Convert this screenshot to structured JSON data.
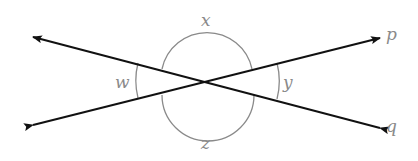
{
  "diagram": {
    "type": "intersecting-lines-angles",
    "lines": [
      {
        "name": "p",
        "label": "p"
      },
      {
        "name": "q",
        "label": "q"
      }
    ],
    "angles": [
      {
        "name": "x",
        "label": "x",
        "position": "top"
      },
      {
        "name": "y",
        "label": "y",
        "position": "right"
      },
      {
        "name": "z",
        "label": "z",
        "position": "bottom"
      },
      {
        "name": "w",
        "label": "w",
        "position": "left"
      }
    ],
    "colors": {
      "line": "#111111",
      "arc": "#8a8a8a",
      "label": "#8a8a8a"
    }
  }
}
